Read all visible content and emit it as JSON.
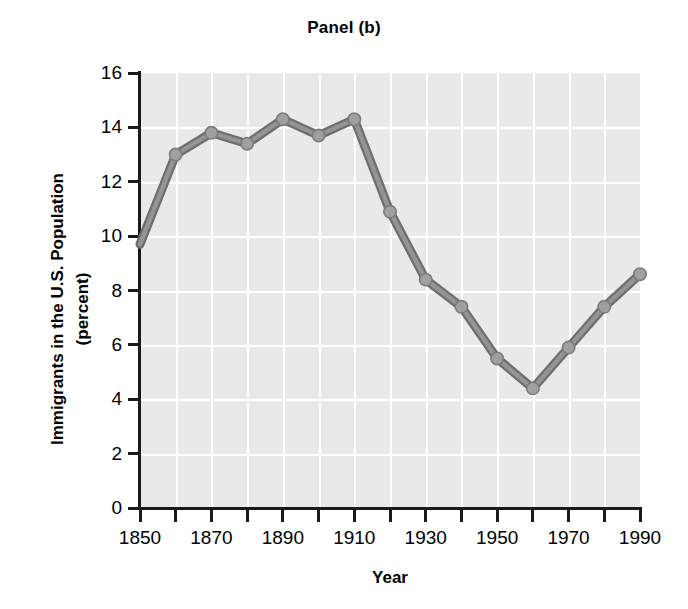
{
  "chart_data": {
    "type": "line",
    "title": "Panel (b)",
    "xlabel": "Year",
    "ylabel": "Immigrants in the U.S. Population (percent)",
    "ylabel_line1": "Immigrants in the U.S. Population",
    "ylabel_line2": "(percent)",
    "x": [
      1850,
      1860,
      1870,
      1880,
      1890,
      1900,
      1910,
      1920,
      1930,
      1940,
      1950,
      1960,
      1970,
      1980,
      1990
    ],
    "values": [
      9.7,
      13.0,
      13.8,
      13.4,
      14.3,
      13.7,
      14.3,
      10.9,
      8.4,
      7.4,
      5.5,
      4.4,
      5.9,
      7.4,
      8.6
    ],
    "series": [
      {
        "name": "Immigrants in the U.S. Population (percent)",
        "values": [
          9.7,
          13.0,
          13.8,
          13.4,
          14.3,
          13.7,
          14.3,
          10.9,
          8.4,
          7.4,
          5.5,
          4.4,
          5.9,
          7.4,
          8.6
        ]
      }
    ],
    "xlim": [
      1850,
      1990
    ],
    "ylim": [
      0,
      16
    ],
    "y_ticks": [
      0,
      2,
      4,
      6,
      8,
      10,
      12,
      14,
      16
    ],
    "y_tick_labels": [
      "0",
      "2",
      "4",
      "6",
      "8",
      "10",
      "12",
      "14",
      "16"
    ],
    "x_ticks": [
      1850,
      1860,
      1870,
      1880,
      1890,
      1900,
      1910,
      1920,
      1930,
      1940,
      1950,
      1960,
      1970,
      1980,
      1990
    ],
    "x_tick_labels": [
      "1850",
      "",
      "1870",
      "",
      "1890",
      "",
      "1910",
      "",
      "1930",
      "",
      "1950",
      "",
      "1970",
      "",
      "1990"
    ],
    "x_major_labels": [
      "1850",
      "1870",
      "1890",
      "1910",
      "1930",
      "1950",
      "1970",
      "1990"
    ],
    "x_major_values": [
      1850,
      1870,
      1890,
      1910,
      1930,
      1950,
      1970,
      1990
    ],
    "grid": true,
    "grid_color": "#ffffff",
    "plot_background": "#e9e9e9",
    "line_color": "#808080",
    "marker_color": "#a0a0a0",
    "marker_shape": "circle",
    "legend": null,
    "legend_position": "none"
  }
}
